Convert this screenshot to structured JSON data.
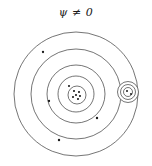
{
  "figure": {
    "title": "ψ ≠ 0",
    "title_symbol": "psi-not-equal-zero",
    "background_color": "#ffffff",
    "stroke_color": "#3a3a3a",
    "dot_color": "#1a1a1a",
    "width": 152,
    "height": 166
  },
  "chart_data": {
    "type": "scatter",
    "title": "ψ ≠ 0",
    "xlabel": "",
    "ylabel": "",
    "xlim": [
      0,
      152
    ],
    "ylim": [
      0,
      166
    ],
    "grid": false,
    "legend": null,
    "shells": [
      {
        "name": "outer-shell",
        "cx": 76,
        "cy": 94,
        "r": 62,
        "stroke_width": 0.7
      },
      {
        "name": "second-shell",
        "cx": 76,
        "cy": 94,
        "r": 45,
        "stroke_width": 0.7
      },
      {
        "name": "third-shell",
        "cx": 76,
        "cy": 94,
        "r": 29,
        "stroke_width": 0.7
      },
      {
        "name": "inner-shell",
        "cx": 76,
        "cy": 94,
        "r": 18,
        "stroke_width": 0.7
      },
      {
        "name": "core-shell",
        "cx": 77,
        "cy": 95,
        "r": 9,
        "stroke_width": 0.7
      }
    ],
    "core_cluster": {
      "name": "core-cluster",
      "count": 6,
      "points": [
        {
          "x": 74,
          "y": 91
        },
        {
          "x": 79,
          "y": 92
        },
        {
          "x": 76,
          "y": 95
        },
        {
          "x": 80,
          "y": 96
        },
        {
          "x": 73,
          "y": 97
        },
        {
          "x": 78,
          "y": 99
        }
      ]
    },
    "scattered_points": {
      "name": "orbiting-particles",
      "count": 5,
      "points": [
        {
          "x": 43,
          "y": 52,
          "shell": "outer-shell"
        },
        {
          "x": 69,
          "y": 86,
          "shell": "inner-shell"
        },
        {
          "x": 49,
          "y": 101,
          "shell": "third-shell"
        },
        {
          "x": 97,
          "y": 118,
          "shell": "second-shell"
        },
        {
          "x": 59,
          "y": 140,
          "shell": "outer-shell"
        }
      ]
    },
    "satellite": {
      "name": "satellite-subsystem",
      "cx": 128,
      "cy": 92,
      "rings": [
        {
          "name": "satellite-outer-ring",
          "r": 10.5,
          "stroke_width": 0.7
        },
        {
          "name": "satellite-mid-ring",
          "r": 7.5,
          "stroke_width": 0.7
        },
        {
          "name": "satellite-inner-ring",
          "r": 4.5,
          "stroke_width": 0.7
        }
      ],
      "points": [
        {
          "x": 127,
          "y": 91
        },
        {
          "x": 131,
          "y": 94
        }
      ]
    }
  }
}
